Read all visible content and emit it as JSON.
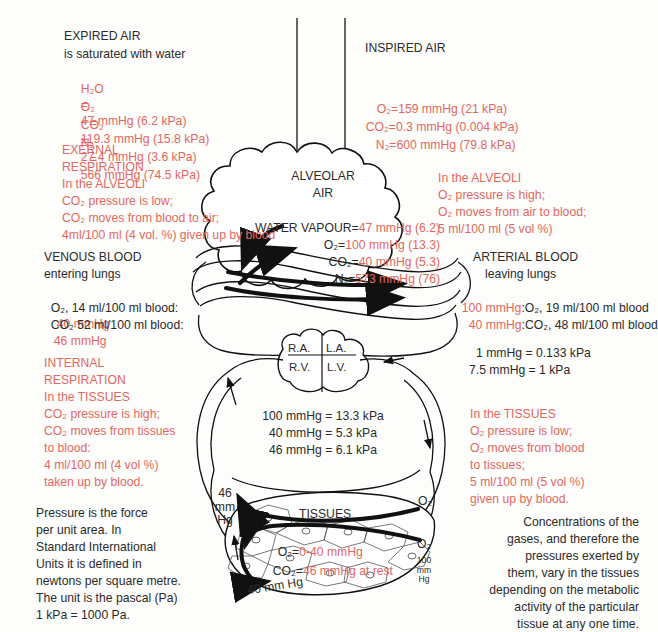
{
  "figure": {
    "colors": {
      "accent_red": "#e2685f",
      "text_dark": "#2b2b2b",
      "background": "#fdfdfb"
    }
  },
  "expired_air": {
    "heading": "EXPIRED AIR",
    "subheading": "is saturated with water",
    "rows": [
      {
        "gas": "H₂O",
        "eq": "=",
        "value": "47 mmHg (6.2 kPa)"
      },
      {
        "gas": "O₂",
        "eq": "=",
        "value": "119.3 mmHg (15.8 kPa)"
      },
      {
        "gas": "CO₂",
        "eq": "=",
        "value": "27.4 mmHg (3.6 kPa)"
      },
      {
        "gas": "N₂",
        "eq": "=",
        "value": "566 mmHg (74.5 kPa)"
      }
    ]
  },
  "inspired_air": {
    "heading": "INSPIRED AIR",
    "rows": [
      {
        "gas": "O₂",
        "eq": "=",
        "value": "159 mmHg (21 kPa)"
      },
      {
        "gas": "CO₂",
        "eq": "=",
        "value": "0.3 mmHg (0.004 kPa)"
      },
      {
        "gas": "N₂",
        "eq": "=",
        "value": "600 mmHg (79.8 kPa)"
      }
    ]
  },
  "external_respiration": {
    "line1": "EXERNAL",
    "line2": "RESPIRATION",
    "line3": "In the ALVEOLI",
    "line4": "CO₂ pressure is low;",
    "line5": "CO₂ moves from blood to air;",
    "line6": "4ml/100 ml (4 vol. %) given up by blood"
  },
  "alveoli_note": {
    "line1": "In the ALVEOLI",
    "line2": "O₂ pressure is high;",
    "line3": "O₂ moves from air to blood;",
    "line4": "5 ml/100 ml (5 vol %)"
  },
  "alveolar_air": {
    "heading_line1": "ALVEOLAR",
    "heading_line2": "AIR",
    "rows": [
      {
        "label": "WATER VAPOUR",
        "eq": "=",
        "value": "47 mmHg (6.2)"
      },
      {
        "label": "O₂",
        "eq": "=",
        "value": "100 mmHg (13.3)"
      },
      {
        "label": "CO₂",
        "eq": "=",
        "value": "40 mmHg (5.3)"
      },
      {
        "label": "N₂",
        "eq": "=",
        "value": "573 mmHg (76)"
      }
    ]
  },
  "venous_blood": {
    "heading": "VENOUS BLOOD",
    "subheading": "entering lungs",
    "row1_label": "O₂, 14 ml/100 ml blood:",
    "row1_value": "40 mmHg",
    "row2_label": "CO₂ 52 ml/100 ml blood:",
    "row2_value": "46 mmHg"
  },
  "arterial_blood": {
    "heading": "ARTERIAL BLOOD",
    "subheading": "leaving lungs",
    "row1_value": "100 mmHg",
    "row1_label": ":O₂, 19 ml/100 ml blood",
    "row2_value": "40 mmHg",
    "row2_label": ":CO₂, 48 ml/100 ml blood"
  },
  "internal_respiration": {
    "line1": "INTERNAL",
    "line2": "RESPIRATION",
    "line3": "In the TISSUES",
    "line4": "CO₂ pressure is high;",
    "line5": "CO₂ moves from tissues",
    "line6": "to blood:",
    "line7": "4 ml/100 ml (4 vol %)",
    "line8": "taken up by blood."
  },
  "tissues_note": {
    "line1": "In the TISSUES",
    "line2": "O₂ pressure is low;",
    "line3": "O₂ moves from blood",
    "line4": "to tissues;",
    "line5": "5 ml/100 ml (5 vol %)",
    "line6": "given up by blood."
  },
  "heart": {
    "right_atrium": "R.A.",
    "left_atrium": "L.A.",
    "right_ventricle": "R.V.",
    "left_ventricle": "L.V."
  },
  "conversion_box": {
    "line1": "1 mmHg = 0.133 kPa",
    "line2": "7.5 mmHg = 1 kPa"
  },
  "conversion_list": [
    "100 mmHg = 13.3 kPa",
    "40 mmHg = 5.3 kPa",
    "46 mmHg = 6.1 kPa"
  ],
  "pressure_definition": {
    "line1": "Pressure is the force",
    "line2": "per unit area. In",
    "line3": "Standard International",
    "line4": "Units it is defined in",
    "line5": "newtons per square metre.",
    "line6": "The unit is the pascal (Pa)",
    "line7": "1 kPa = 1000 Pa."
  },
  "tissues": {
    "label": "TISSUES",
    "o2_label": "O₂",
    "eq": "=",
    "o2_value": "0-40 mmHg",
    "co2_label": "CO₂",
    "co2_value": "46 mmHg at rest",
    "marker_o2_top": "O₂",
    "marker_o2_bottom": "O₂",
    "marker_46": "46\nmm\nHg",
    "marker_100": "100\nmm\nHg",
    "marker_40": "40 mm Hg"
  },
  "concentration_note": {
    "line1": "Concentrations of the",
    "line2": "gases, and therefore the",
    "line3": "pressures exerted by",
    "line4": "them, vary in the tissues",
    "line5": "depending on the metabolic",
    "line6": "activity of the particular",
    "line7": "tissue at any one time."
  }
}
